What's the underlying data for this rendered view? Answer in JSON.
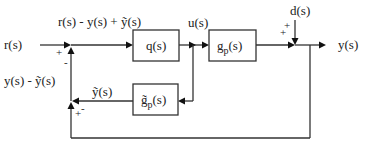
{
  "diagram": {
    "type": "block-diagram",
    "signals": {
      "input": "r(s)",
      "error_top": "r(s) - y(s) + ỹ(s)",
      "control": "u(s)",
      "disturbance": "d(s)",
      "output": "y(s)",
      "model_output": "ỹ(s)",
      "feedback": "y(s) - ỹ(s)"
    },
    "blocks": [
      {
        "id": "controller",
        "label": "q(s)"
      },
      {
        "id": "plant",
        "label": "g",
        "subscript": "p",
        "suffix": "(s)"
      },
      {
        "id": "model",
        "label": "g̃",
        "subscript": "p",
        "suffix": "(s)"
      }
    ],
    "summing_junctions": [
      {
        "id": "sum1",
        "signs": [
          "+",
          "-"
        ]
      },
      {
        "id": "sum2",
        "signs": [
          "+",
          "+"
        ]
      },
      {
        "id": "sum3",
        "signs": [
          "+",
          "-"
        ]
      }
    ]
  }
}
